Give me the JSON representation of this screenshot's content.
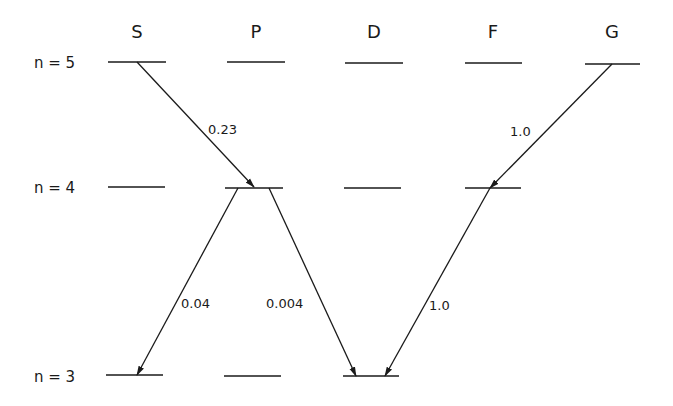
{
  "diagram": {
    "title": "",
    "columns": [
      {
        "label": "S",
        "x": 137
      },
      {
        "label": "P",
        "x": 256
      },
      {
        "label": "D",
        "x": 374
      },
      {
        "label": "F",
        "x": 493
      },
      {
        "label": "G",
        "x": 612
      }
    ],
    "rows": [
      {
        "label": "n = 5",
        "y": 62
      },
      {
        "label": "n = 4",
        "y": 187
      },
      {
        "label": "n = 3",
        "y": 376
      }
    ],
    "levels": [
      {
        "row": 0,
        "col": 0,
        "x1": 108,
        "x2": 166,
        "y": 62
      },
      {
        "row": 0,
        "col": 1,
        "x1": 227,
        "x2": 285,
        "y": 62
      },
      {
        "row": 0,
        "col": 2,
        "x1": 345,
        "x2": 403,
        "y": 63
      },
      {
        "row": 0,
        "col": 3,
        "x1": 465,
        "x2": 522,
        "y": 63
      },
      {
        "row": 0,
        "col": 4,
        "x1": 585,
        "x2": 640,
        "y": 64
      },
      {
        "row": 1,
        "col": 0,
        "x1": 108,
        "x2": 165,
        "y": 187
      },
      {
        "row": 1,
        "col": 1,
        "x1": 225,
        "x2": 283,
        "y": 188
      },
      {
        "row": 1,
        "col": 2,
        "x1": 344,
        "x2": 401,
        "y": 188
      },
      {
        "row": 1,
        "col": 3,
        "x1": 465,
        "x2": 521,
        "y": 188
      },
      {
        "row": 2,
        "col": 0,
        "x1": 106,
        "x2": 163,
        "y": 375
      },
      {
        "row": 2,
        "col": 1,
        "x1": 224,
        "x2": 281,
        "y": 376
      },
      {
        "row": 2,
        "col": 2,
        "x1": 343,
        "x2": 399,
        "y": 376
      }
    ],
    "transitions": [
      {
        "from": "5S",
        "to": "4P",
        "value": "0.23",
        "x1": 137,
        "y1": 62,
        "x2": 254,
        "y2": 187,
        "label_x": 208,
        "label_y": 134
      },
      {
        "from": "5G",
        "to": "4F",
        "value": "1.0",
        "x1": 612,
        "y1": 64,
        "x2": 490,
        "y2": 188,
        "label_x": 510,
        "label_y": 136
      },
      {
        "from": "4P",
        "to": "3S",
        "value": "0.04",
        "x1": 238,
        "y1": 188,
        "x2": 137,
        "y2": 375,
        "label_x": 181,
        "label_y": 308
      },
      {
        "from": "4P",
        "to": "3D",
        "value": "0.004",
        "x1": 269,
        "y1": 188,
        "x2": 356,
        "y2": 376,
        "label_x": 266,
        "label_y": 308
      },
      {
        "from": "4F",
        "to": "3D",
        "value": "1.0",
        "x1": 490,
        "y1": 188,
        "x2": 385,
        "y2": 376,
        "label_x": 428,
        "label_y": 310
      }
    ]
  }
}
